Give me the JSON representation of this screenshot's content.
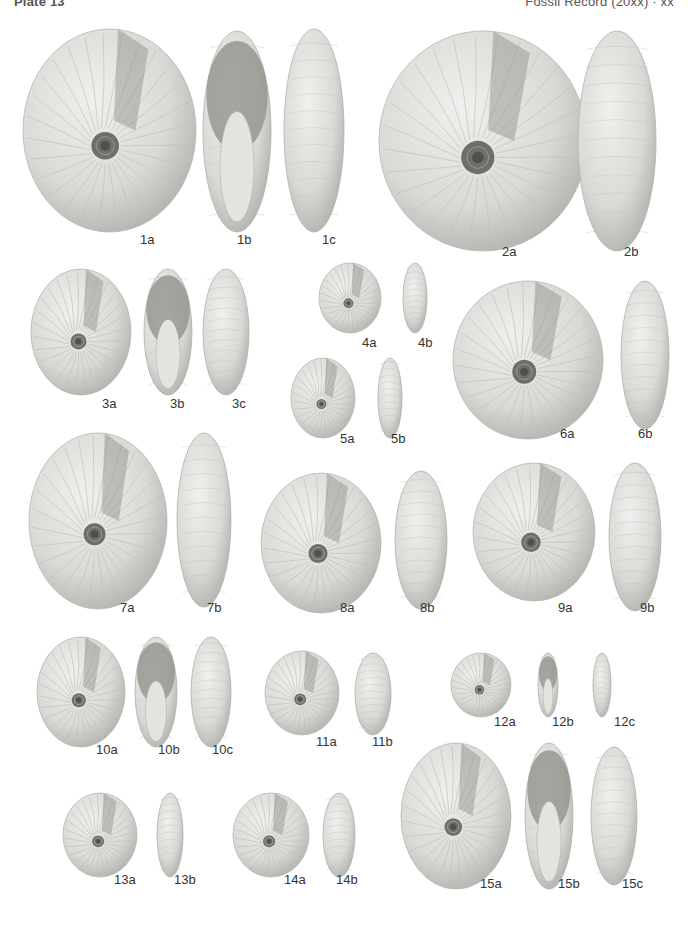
{
  "header": {
    "left": "Plate 13",
    "right": "Fossil Record (20xx) · xx"
  },
  "figure": {
    "type": "paleontological plate",
    "background": "#ffffff",
    "shell_color": "#d9d9d6",
    "matrix_color": "#8f8c86"
  },
  "specimens": [
    {
      "id": "1a",
      "view": "lateral",
      "x": 22,
      "y": 28,
      "w": 175,
      "h": 205,
      "lx": 148,
      "ly": 236,
      "label": "1a"
    },
    {
      "id": "1b",
      "view": "apertural",
      "x": 202,
      "y": 30,
      "w": 70,
      "h": 203,
      "lx": 245,
      "ly": 236,
      "label": "1b"
    },
    {
      "id": "1c",
      "view": "ventral",
      "x": 283,
      "y": 28,
      "w": 62,
      "h": 205,
      "lx": 330,
      "ly": 236,
      "label": "1c"
    },
    {
      "id": "2a",
      "view": "lateral",
      "x": 378,
      "y": 30,
      "w": 210,
      "h": 222,
      "lx": 510,
      "ly": 248,
      "label": "2a"
    },
    {
      "id": "2b",
      "view": "ventral",
      "x": 577,
      "y": 30,
      "w": 80,
      "h": 222,
      "lx": 632,
      "ly": 248,
      "label": "2b"
    },
    {
      "id": "3a",
      "view": "lateral",
      "x": 30,
      "y": 268,
      "w": 102,
      "h": 128,
      "lx": 110,
      "ly": 400,
      "label": "3a"
    },
    {
      "id": "3b",
      "view": "apertural",
      "x": 143,
      "y": 268,
      "w": 50,
      "h": 128,
      "lx": 178,
      "ly": 400,
      "label": "3b"
    },
    {
      "id": "3c",
      "view": "ventral",
      "x": 202,
      "y": 268,
      "w": 48,
      "h": 128,
      "lx": 240,
      "ly": 400,
      "label": "3c"
    },
    {
      "id": "4a",
      "view": "lateral",
      "x": 318,
      "y": 262,
      "w": 64,
      "h": 72,
      "lx": 370,
      "ly": 339,
      "label": "4a"
    },
    {
      "id": "4b",
      "view": "ventral",
      "x": 402,
      "y": 262,
      "w": 26,
      "h": 72,
      "lx": 426,
      "ly": 339,
      "label": "4b"
    },
    {
      "id": "5a",
      "view": "lateral",
      "x": 290,
      "y": 357,
      "w": 66,
      "h": 82,
      "lx": 348,
      "ly": 435,
      "label": "5a"
    },
    {
      "id": "5b",
      "view": "ventral",
      "x": 377,
      "y": 357,
      "w": 26,
      "h": 82,
      "lx": 399,
      "ly": 435,
      "label": "5b"
    },
    {
      "id": "6a",
      "view": "lateral",
      "x": 452,
      "y": 280,
      "w": 152,
      "h": 160,
      "lx": 568,
      "ly": 430,
      "label": "6a"
    },
    {
      "id": "6b",
      "view": "ventral",
      "x": 620,
      "y": 280,
      "w": 50,
      "h": 150,
      "lx": 646,
      "ly": 430,
      "label": "6b"
    },
    {
      "id": "7a",
      "view": "lateral",
      "x": 28,
      "y": 432,
      "w": 140,
      "h": 178,
      "lx": 128,
      "ly": 604,
      "label": "7a"
    },
    {
      "id": "7b",
      "view": "ventral",
      "x": 176,
      "y": 432,
      "w": 56,
      "h": 176,
      "lx": 215,
      "ly": 604,
      "label": "7b"
    },
    {
      "id": "8a",
      "view": "lateral",
      "x": 260,
      "y": 472,
      "w": 122,
      "h": 142,
      "lx": 348,
      "ly": 604,
      "label": "8a"
    },
    {
      "id": "8b",
      "view": "ventral",
      "x": 394,
      "y": 470,
      "w": 54,
      "h": 140,
      "lx": 428,
      "ly": 604,
      "label": "8b"
    },
    {
      "id": "9a",
      "view": "lateral",
      "x": 472,
      "y": 462,
      "w": 124,
      "h": 140,
      "lx": 566,
      "ly": 604,
      "label": "9a"
    },
    {
      "id": "9b",
      "view": "ventral",
      "x": 608,
      "y": 462,
      "w": 54,
      "h": 150,
      "lx": 648,
      "ly": 604,
      "label": "9b"
    },
    {
      "id": "10a",
      "view": "lateral",
      "x": 36,
      "y": 636,
      "w": 90,
      "h": 112,
      "lx": 104,
      "ly": 746,
      "label": "10a"
    },
    {
      "id": "10b",
      "view": "apertural",
      "x": 134,
      "y": 636,
      "w": 44,
      "h": 112,
      "lx": 166,
      "ly": 746,
      "label": "10b"
    },
    {
      "id": "10c",
      "view": "ventral",
      "x": 190,
      "y": 636,
      "w": 42,
      "h": 112,
      "lx": 220,
      "ly": 746,
      "label": "10c"
    },
    {
      "id": "11a",
      "view": "lateral",
      "x": 264,
      "y": 650,
      "w": 76,
      "h": 86,
      "lx": 324,
      "ly": 738,
      "label": "11a"
    },
    {
      "id": "11b",
      "view": "ventral",
      "x": 354,
      "y": 652,
      "w": 38,
      "h": 84,
      "lx": 380,
      "ly": 738,
      "label": "11b"
    },
    {
      "id": "12a",
      "view": "lateral",
      "x": 450,
      "y": 652,
      "w": 62,
      "h": 66,
      "lx": 502,
      "ly": 718,
      "label": "12a"
    },
    {
      "id": "12b",
      "view": "apertural",
      "x": 537,
      "y": 652,
      "w": 22,
      "h": 66,
      "lx": 560,
      "ly": 718,
      "label": "12b"
    },
    {
      "id": "12c",
      "view": "ventral",
      "x": 592,
      "y": 652,
      "w": 20,
      "h": 66,
      "lx": 622,
      "ly": 718,
      "label": "12c"
    },
    {
      "id": "13a",
      "view": "lateral",
      "x": 62,
      "y": 792,
      "w": 76,
      "h": 86,
      "lx": 122,
      "ly": 876,
      "label": "13a"
    },
    {
      "id": "13b",
      "view": "ventral",
      "x": 156,
      "y": 792,
      "w": 28,
      "h": 86,
      "lx": 182,
      "ly": 876,
      "label": "13b"
    },
    {
      "id": "14a",
      "view": "lateral",
      "x": 232,
      "y": 792,
      "w": 78,
      "h": 86,
      "lx": 292,
      "ly": 876,
      "label": "14a"
    },
    {
      "id": "14b",
      "view": "ventral",
      "x": 322,
      "y": 792,
      "w": 34,
      "h": 86,
      "lx": 344,
      "ly": 876,
      "label": "14b"
    },
    {
      "id": "15a",
      "view": "lateral",
      "x": 400,
      "y": 742,
      "w": 112,
      "h": 148,
      "lx": 488,
      "ly": 880,
      "label": "15a"
    },
    {
      "id": "15b",
      "view": "apertural",
      "x": 524,
      "y": 742,
      "w": 50,
      "h": 148,
      "lx": 566,
      "ly": 880,
      "label": "15b"
    },
    {
      "id": "15c",
      "view": "ventral",
      "x": 590,
      "y": 746,
      "w": 48,
      "h": 140,
      "lx": 630,
      "ly": 880,
      "label": "15c"
    }
  ]
}
